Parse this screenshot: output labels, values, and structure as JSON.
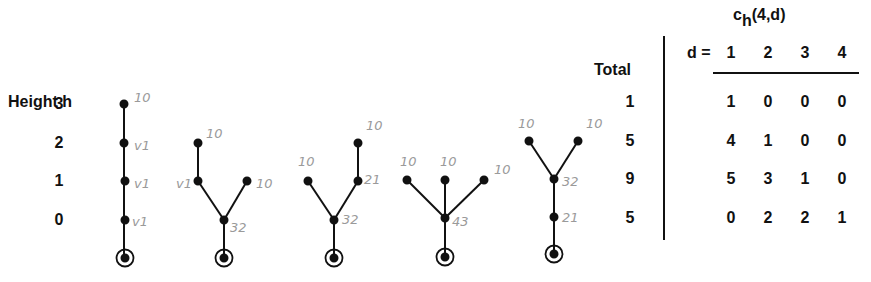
{
  "axis": {
    "label": "Height h",
    "heights": [
      "3",
      "2",
      "1",
      "0"
    ]
  },
  "trees": [
    {
      "id": "tree-1",
      "shape": "path of 4 nodes",
      "annotations": [
        "10",
        "v1",
        "v1",
        "v1"
      ]
    },
    {
      "id": "tree-2",
      "shape": "branch at height 0 into path(2) and leaf",
      "annotations": [
        "10",
        "v1",
        "10",
        "32"
      ]
    },
    {
      "id": "tree-3",
      "shape": "branch at height 0 into leaf and path(2)",
      "annotations": [
        "10",
        "10",
        "21",
        "32"
      ]
    },
    {
      "id": "tree-4",
      "shape": "star with 3 leaves at height 1",
      "annotations": [
        "10",
        "10",
        "10",
        "43"
      ]
    },
    {
      "id": "tree-5",
      "shape": "path then branch into 2 leaves at height 2",
      "annotations": [
        "10",
        "10",
        "32",
        "21"
      ]
    }
  ],
  "table": {
    "title_main": "c",
    "title_sub": "h",
    "title_args": "(4,d)",
    "total_header": "Total",
    "d_label": "d =",
    "columns": [
      "1",
      "2",
      "3",
      "4"
    ],
    "rows": [
      {
        "height": "3",
        "total": "1",
        "values": [
          "1",
          "0",
          "0",
          "0"
        ]
      },
      {
        "height": "2",
        "total": "5",
        "values": [
          "4",
          "1",
          "0",
          "0"
        ]
      },
      {
        "height": "1",
        "total": "9",
        "values": [
          "5",
          "3",
          "1",
          "0"
        ]
      },
      {
        "height": "0",
        "total": "5",
        "values": [
          "0",
          "2",
          "2",
          "1"
        ]
      }
    ]
  }
}
